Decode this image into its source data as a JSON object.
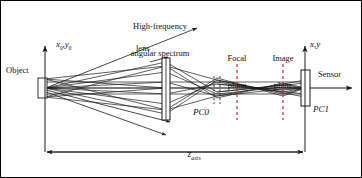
{
  "figure": {
    "title_hidden": "Optical imaging system ray diagram",
    "background_color": "#ffffff",
    "stroke_color": "#1a1a1a",
    "dashed_color": "#2b2b2b",
    "width": 362,
    "height": 178
  },
  "labels": {
    "high_freq_line1": "High-frequency",
    "high_freq_line2": "angular spectrum",
    "object": "Object",
    "lens": "lens",
    "focal_line1": "Focal",
    "focal_line2": "plane",
    "image_line1": "Image",
    "image_line2": "plane",
    "sensor": "Sensor",
    "pc0": "PC0",
    "pc1": "PC1",
    "axis_in_x": "x",
    "axis_in_x_sub": "0",
    "axis_in_comma": ",",
    "axis_in_y": "y",
    "axis_in_y_sub": "0",
    "axis_out": "x,y",
    "z_axis_main": "z",
    "z_axis_sub": "axis"
  },
  "geometry": {
    "object_point_x": 45,
    "object_point_y": 88,
    "lens_x": 166,
    "focal_plane_x": 237,
    "image_plane_x": 283,
    "sensor_x": 305,
    "z_axis_y": 152,
    "pc0_x": 217
  }
}
